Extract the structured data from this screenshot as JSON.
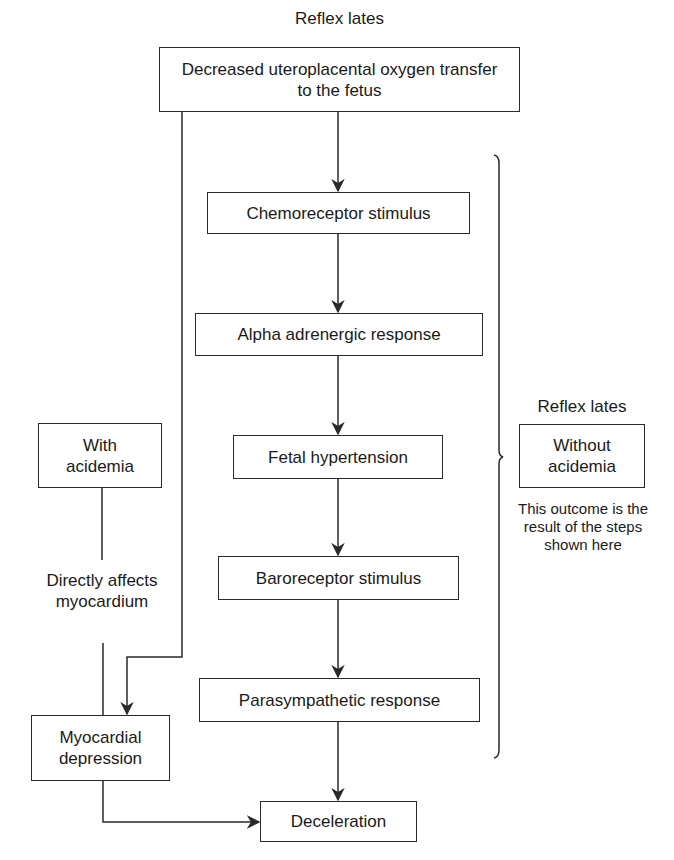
{
  "diagram": {
    "top_heading": "Reflex lates",
    "nodes": {
      "start": "Decreased uteroplacental oxygen transfer to the fetus",
      "chemoreceptor": "Chemoreceptor stimulus",
      "alpha": "Alpha adrenergic response",
      "hypertension": "Fetal hypertension",
      "baroreceptor": "Baroreceptor stimulus",
      "parasympathetic": "Parasympathetic response",
      "deceleration": "Deceleration",
      "with_acidemia": "With acidemia",
      "myocardial": "Myocardial depression",
      "without_acidemia": "Without acidemia"
    },
    "left_path_label": "Directly affects myocardium",
    "right_heading": "Reflex lates",
    "right_caption": "This outcome is the result of the steps shown here",
    "edges": [
      [
        "start",
        "chemoreceptor"
      ],
      [
        "chemoreceptor",
        "alpha"
      ],
      [
        "alpha",
        "hypertension"
      ],
      [
        "hypertension",
        "baroreceptor"
      ],
      [
        "baroreceptor",
        "parasympathetic"
      ],
      [
        "parasympathetic",
        "deceleration"
      ],
      [
        "start",
        "myocardial"
      ],
      [
        "with_acidemia",
        "myocardial"
      ],
      [
        "myocardial",
        "deceleration"
      ]
    ],
    "colors": {
      "line": "#2a2a2a",
      "background": "#ffffff",
      "text": "#1a1a1a"
    }
  }
}
